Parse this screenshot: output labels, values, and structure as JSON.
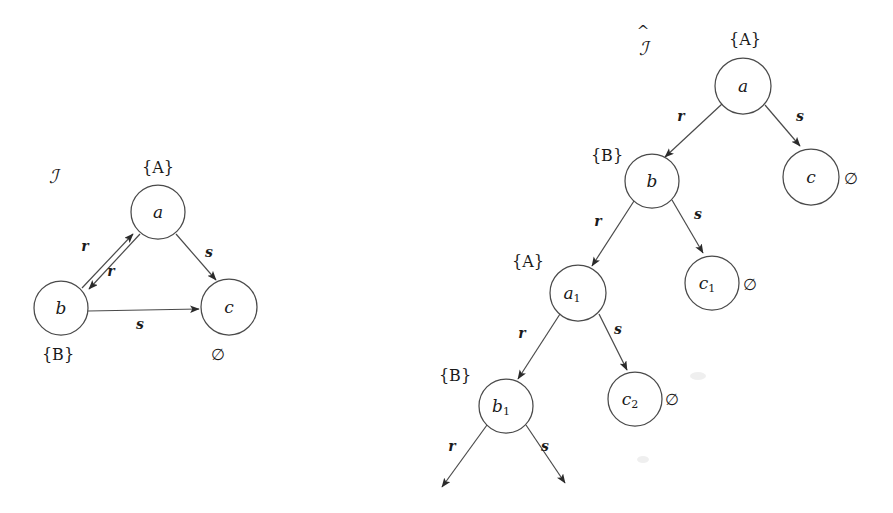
{
  "figure": {
    "caption_left": "I",
    "caption_right": "I-hat",
    "background": "#ffffff",
    "stroke_color": "#4a4a4a",
    "text_color": "#1a1a1a"
  },
  "left_structure": {
    "name": "ℐ",
    "name_x": 53,
    "name_y": 178,
    "nodes": [
      {
        "id": "a",
        "label": "a",
        "sub": "",
        "cx": 158,
        "cy": 212,
        "r": 27,
        "set_label": "{A}",
        "set_x": 158,
        "set_y": 168
      },
      {
        "id": "b",
        "label": "b",
        "sub": "",
        "cx": 61,
        "cy": 308,
        "r": 27,
        "set_label": "{B}",
        "set_x": 58,
        "set_y": 355
      },
      {
        "id": "c",
        "label": "c",
        "sub": "",
        "cx": 229,
        "cy": 307,
        "r": 28,
        "set_label": "∅",
        "set_x": 218,
        "set_y": 355
      }
    ],
    "edges": [
      {
        "from": "b",
        "to": "a",
        "label": "r",
        "label_x": 85,
        "label_y": 247
      },
      {
        "from": "a",
        "to": "b",
        "label": "r",
        "label_x": 111,
        "label_y": 272
      },
      {
        "from": "b",
        "to": "c",
        "label": "s",
        "label_x": 140,
        "label_y": 325
      },
      {
        "from": "a",
        "to": "c",
        "label": "s",
        "label_x": 209,
        "label_y": 253
      }
    ]
  },
  "right_structure": {
    "name": "ℐ",
    "name_has_hat": true,
    "name_x": 643,
    "name_y": 48,
    "nodes": [
      {
        "id": "a",
        "label": "a",
        "sub": "",
        "cx": 743,
        "cy": 86,
        "r": 28,
        "set_label": "{A}",
        "set_x": 745,
        "set_y": 40
      },
      {
        "id": "b",
        "label": "b",
        "sub": "",
        "cx": 652,
        "cy": 181,
        "r": 27,
        "set_label": "{B}",
        "set_x": 607,
        "set_y": 156
      },
      {
        "id": "c",
        "label": "c",
        "sub": "",
        "cx": 811,
        "cy": 177,
        "r": 28,
        "set_label": "∅",
        "set_x": 851,
        "set_y": 179
      },
      {
        "id": "a1",
        "label": "a",
        "sub": "1",
        "cx": 578,
        "cy": 293,
        "r": 28,
        "set_label": "{A}",
        "set_x": 528,
        "set_y": 262
      },
      {
        "id": "c1",
        "label": "c",
        "sub": "1",
        "cx": 712,
        "cy": 283,
        "r": 27,
        "set_label": "∅",
        "set_x": 750,
        "set_y": 285
      },
      {
        "id": "b1",
        "label": "b",
        "sub": "1",
        "cx": 506,
        "cy": 406,
        "r": 27,
        "set_label": "{B}",
        "set_x": 455,
        "set_y": 376
      },
      {
        "id": "c2",
        "label": "c",
        "sub": "2",
        "cx": 635,
        "cy": 399,
        "r": 27,
        "set_label": "∅",
        "set_x": 672,
        "set_y": 400
      }
    ],
    "edges": [
      {
        "from": "a",
        "to": "b",
        "label": "r",
        "label_x": 681,
        "label_y": 117
      },
      {
        "from": "a",
        "to": "c",
        "label": "s",
        "label_x": 800,
        "label_y": 117
      },
      {
        "from": "b",
        "to": "a1",
        "label": "r",
        "label_x": 598,
        "label_y": 222
      },
      {
        "from": "b",
        "to": "c1",
        "label": "s",
        "label_x": 698,
        "label_y": 215
      },
      {
        "from": "a1",
        "to": "b1",
        "label": "r",
        "label_x": 522,
        "label_y": 334
      },
      {
        "from": "a1",
        "to": "c2",
        "label": "s",
        "label_x": 618,
        "label_y": 330
      }
    ],
    "open_edges": [
      {
        "from": "b1",
        "label": "r",
        "label_x": 452,
        "label_y": 447,
        "x1": 487,
        "y1": 425,
        "x2": 442,
        "y2": 487
      },
      {
        "from": "b1",
        "label": "s",
        "label_x": 545,
        "label_y": 447,
        "x1": 526,
        "y1": 425,
        "x2": 565,
        "y2": 483
      }
    ]
  }
}
